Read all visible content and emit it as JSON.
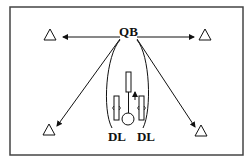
{
  "diagram": {
    "labels": {
      "qb": "QB",
      "dl_left": "DL",
      "dl_right": "DL"
    },
    "cones": [
      "top-left",
      "top-right",
      "bottom-left",
      "bottom-right"
    ],
    "colors": {
      "stroke": "#111111",
      "background": "#ffffff",
      "border": "#444444"
    }
  }
}
